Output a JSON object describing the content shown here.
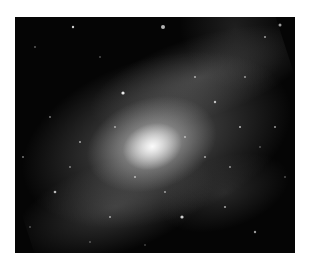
{
  "image": {
    "subject": "spiral galaxy",
    "style": "grayscale astronomical photograph",
    "alt": "Grayscale photograph of a face-on spiral galaxy with a bright core, mottled spiral arms, and scattered stars on a black sky"
  },
  "colors": {
    "page_background": "#ffffff",
    "sky": "#050505",
    "core": "#f5f5f5"
  }
}
